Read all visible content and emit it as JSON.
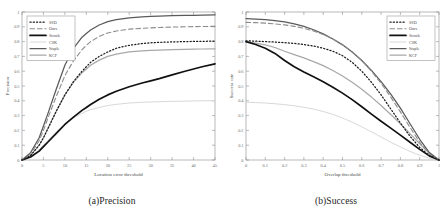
{
  "figure": {
    "panels": [
      {
        "id": "precision",
        "caption": "(a)Precision",
        "xlabel": "Location error threshold",
        "ylabel": "Precision",
        "legend_position": "top-left"
      },
      {
        "id": "success",
        "caption": "(b)Success",
        "xlabel": "Overlap threshold",
        "ylabel": "Success rate",
        "legend_position": "top-right"
      }
    ]
  },
  "legend": {
    "entries": [
      {
        "label": "SSD",
        "style": "dotted",
        "color": "#1b1b1b",
        "width": 1.25
      },
      {
        "label": "Ours",
        "style": "dashed",
        "color": "#8c8c8c",
        "width": 1.1
      },
      {
        "label": "Struck",
        "style": "solid",
        "color": "#111111",
        "width": 1.7
      },
      {
        "label": "CSK",
        "style": "solid",
        "color": "#d8d8d8",
        "width": 1.0
      },
      {
        "label": "Staple",
        "style": "solid",
        "color": "#5a5a5a",
        "width": 1.25
      },
      {
        "label": "KCF",
        "style": "solid",
        "color": "#a8a8a8",
        "width": 1.25
      }
    ]
  },
  "chart_data": [
    {
      "type": "line",
      "title": "(a)Precision",
      "xlabel": "Location error threshold",
      "ylabel": "Precision",
      "xlim": [
        0,
        45
      ],
      "ylim": [
        0,
        1
      ],
      "xticks": [
        0,
        5,
        10,
        15,
        20,
        25,
        30,
        35,
        40,
        45
      ],
      "yticks": [
        0,
        0.1,
        0.2,
        0.3,
        0.4,
        0.5,
        0.6,
        0.7,
        0.8,
        0.9,
        1
      ],
      "xtick_labels": [
        "0",
        "5",
        "10",
        "15",
        "20",
        "25",
        "30",
        "35",
        "40",
        "45"
      ],
      "ytick_labels": [
        "0",
        "0.1",
        "0.2",
        "0.3",
        "0.4",
        "0.5",
        "0.6",
        "0.7",
        "0.8",
        "0.9",
        "1"
      ],
      "grid": false,
      "legend_position": "upper left",
      "x": [
        0,
        2,
        4,
        5,
        6,
        8,
        10,
        12,
        14,
        15,
        16,
        18,
        20,
        22,
        25,
        28,
        30,
        32,
        35,
        38,
        40,
        42,
        45
      ],
      "series": [
        {
          "name": "SSD",
          "values": [
            0.0,
            0.03,
            0.1,
            0.15,
            0.21,
            0.33,
            0.44,
            0.53,
            0.6,
            0.63,
            0.66,
            0.7,
            0.73,
            0.755,
            0.775,
            0.787,
            0.792,
            0.795,
            0.798,
            0.8,
            0.801,
            0.802,
            0.803
          ]
        },
        {
          "name": "Ours",
          "values": [
            0.0,
            0.04,
            0.13,
            0.2,
            0.28,
            0.43,
            0.57,
            0.67,
            0.745,
            0.775,
            0.8,
            0.835,
            0.858,
            0.872,
            0.884,
            0.89,
            0.893,
            0.895,
            0.898,
            0.9,
            0.901,
            0.902,
            0.903
          ]
        },
        {
          "name": "Struck",
          "values": [
            0.0,
            0.02,
            0.06,
            0.09,
            0.12,
            0.18,
            0.24,
            0.29,
            0.335,
            0.355,
            0.375,
            0.41,
            0.44,
            0.465,
            0.495,
            0.52,
            0.535,
            0.55,
            0.575,
            0.6,
            0.615,
            0.63,
            0.65
          ]
        },
        {
          "name": "CSK",
          "values": [
            0.0,
            0.02,
            0.07,
            0.1,
            0.13,
            0.19,
            0.245,
            0.285,
            0.315,
            0.33,
            0.34,
            0.355,
            0.368,
            0.376,
            0.385,
            0.39,
            0.392,
            0.394,
            0.396,
            0.398,
            0.399,
            0.4,
            0.401
          ]
        },
        {
          "name": "Staple",
          "values": [
            0.0,
            0.05,
            0.15,
            0.23,
            0.31,
            0.48,
            0.64,
            0.755,
            0.83,
            0.855,
            0.878,
            0.912,
            0.935,
            0.948,
            0.96,
            0.967,
            0.97,
            0.972,
            0.975,
            0.977,
            0.978,
            0.979,
            0.98
          ]
        },
        {
          "name": "KCF",
          "values": [
            0.0,
            0.03,
            0.1,
            0.15,
            0.21,
            0.33,
            0.44,
            0.525,
            0.59,
            0.615,
            0.64,
            0.675,
            0.7,
            0.715,
            0.73,
            0.738,
            0.741,
            0.743,
            0.746,
            0.748,
            0.749,
            0.75,
            0.751
          ]
        }
      ]
    },
    {
      "type": "line",
      "title": "(b)Success",
      "xlabel": "Overlap threshold",
      "ylabel": "Success rate",
      "xlim": [
        0,
        1
      ],
      "ylim": [
        0,
        1
      ],
      "xticks": [
        0,
        0.1,
        0.2,
        0.3,
        0.4,
        0.5,
        0.6,
        0.7,
        0.8,
        0.9,
        1
      ],
      "yticks": [
        0,
        0.1,
        0.2,
        0.3,
        0.4,
        0.5,
        0.6,
        0.7,
        0.8,
        0.9,
        1
      ],
      "xtick_labels": [
        "0",
        "0.1",
        "0.2",
        "0.3",
        "0.4",
        "0.5",
        "0.6",
        "0.7",
        "0.8",
        "0.9",
        "1"
      ],
      "ytick_labels": [
        "0",
        "0.1",
        "0.2",
        "0.3",
        "0.4",
        "0.5",
        "0.6",
        "0.7",
        "0.8",
        "0.9",
        "1"
      ],
      "grid": false,
      "legend_position": "upper right",
      "x": [
        0,
        0.05,
        0.1,
        0.15,
        0.2,
        0.25,
        0.3,
        0.35,
        0.4,
        0.45,
        0.5,
        0.55,
        0.6,
        0.65,
        0.7,
        0.75,
        0.8,
        0.85,
        0.9,
        0.95,
        1
      ],
      "series": [
        {
          "name": "SSD",
          "values": [
            0.805,
            0.803,
            0.8,
            0.797,
            0.793,
            0.788,
            0.78,
            0.77,
            0.755,
            0.735,
            0.705,
            0.66,
            0.6,
            0.525,
            0.44,
            0.345,
            0.25,
            0.16,
            0.085,
            0.03,
            0.0
          ]
        },
        {
          "name": "Ours",
          "values": [
            0.93,
            0.928,
            0.925,
            0.92,
            0.913,
            0.903,
            0.89,
            0.872,
            0.848,
            0.818,
            0.78,
            0.732,
            0.672,
            0.6,
            0.518,
            0.425,
            0.325,
            0.22,
            0.12,
            0.04,
            0.0
          ]
        },
        {
          "name": "Struck",
          "values": [
            0.8,
            0.78,
            0.755,
            0.72,
            0.672,
            0.63,
            0.595,
            0.562,
            0.528,
            0.492,
            0.452,
            0.408,
            0.36,
            0.31,
            0.262,
            0.215,
            0.168,
            0.12,
            0.072,
            0.028,
            0.0
          ]
        },
        {
          "name": "CSK",
          "values": [
            0.39,
            0.388,
            0.385,
            0.38,
            0.374,
            0.366,
            0.356,
            0.344,
            0.328,
            0.308,
            0.284,
            0.256,
            0.224,
            0.19,
            0.155,
            0.12,
            0.088,
            0.058,
            0.032,
            0.012,
            0.0
          ]
        },
        {
          "name": "Staple",
          "values": [
            0.955,
            0.952,
            0.948,
            0.942,
            0.933,
            0.92,
            0.903,
            0.88,
            0.852,
            0.818,
            0.778,
            0.73,
            0.672,
            0.605,
            0.53,
            0.445,
            0.35,
            0.245,
            0.14,
            0.05,
            0.0
          ]
        },
        {
          "name": "KCF",
          "values": [
            0.8,
            0.79,
            0.778,
            0.76,
            0.735,
            0.712,
            0.69,
            0.665,
            0.638,
            0.605,
            0.568,
            0.525,
            0.478,
            0.425,
            0.368,
            0.308,
            0.245,
            0.178,
            0.11,
            0.045,
            0.0
          ]
        }
      ]
    }
  ]
}
